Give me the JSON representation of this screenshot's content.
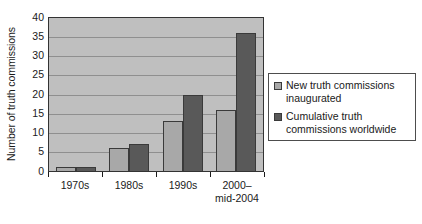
{
  "chart_data": {
    "type": "bar",
    "title": "",
    "xlabel": "",
    "ylabel": "Number of truth commissions",
    "ylim": [
      0,
      40
    ],
    "ytick_step": 5,
    "yticks": [
      "40",
      "35",
      "30",
      "25",
      "20",
      "15",
      "10",
      "5",
      "0"
    ],
    "grid": true,
    "legend_position": "right",
    "categories": [
      "1970s",
      "1980s",
      "1990s",
      "2000– mid-2004"
    ],
    "category_labels": [
      {
        "line1": "1970s",
        "line2": ""
      },
      {
        "line1": "1980s",
        "line2": ""
      },
      {
        "line1": "1990s",
        "line2": ""
      },
      {
        "line1": "2000–",
        "line2": "mid-2004"
      }
    ],
    "series": [
      {
        "name": "New truth commissions inaugurated",
        "name_line1": "New truth commissions",
        "name_line2": "inaugurated",
        "color": "#a8a8a8",
        "values": [
          1,
          6,
          13,
          16
        ]
      },
      {
        "name": "Cumulative truth commissions worldwide",
        "name_line1": "Cumulative truth",
        "name_line2": "commissions worldwide",
        "color": "#595959",
        "values": [
          1,
          7,
          20,
          36
        ]
      }
    ]
  },
  "style": {
    "plot_background": "#bfbfbf",
    "gridline_color": "#8f8f8f",
    "axis_color": "#1a1a1a",
    "legend_border": "#4d4d4d",
    "page_background": "#ffffff"
  }
}
